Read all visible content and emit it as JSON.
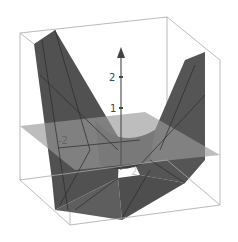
{
  "figure": {
    "type": "3d-surface-plot",
    "colors": {
      "background": "#ffffff",
      "box_edges": "#a0a0a0",
      "surface": "#4a4a4a",
      "surface_light": "#5e5e5e",
      "plane": "#8c8c8c",
      "axis": "#555555"
    }
  },
  "axis": {
    "z_ticks": [
      {
        "label": "1",
        "value": 1
      },
      {
        "label": "2",
        "value": 2
      }
    ]
  },
  "labels": {
    "x_neg": "-2",
    "y_pos": "2"
  }
}
